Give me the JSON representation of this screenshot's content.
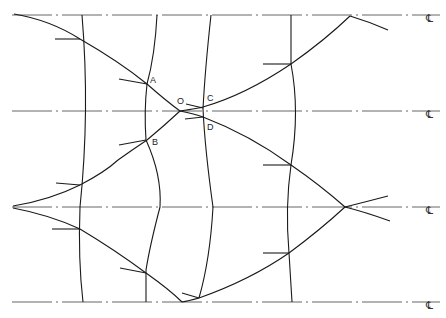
{
  "figure": {
    "type": "slip-line / characteristic network diagram",
    "colors": {
      "line": "#1a1a1a",
      "centerline": "#555555",
      "background": "#ffffff"
    }
  },
  "centerlines": [
    {
      "y": 15,
      "symbol": "℄"
    },
    {
      "y": 111,
      "symbol": "℄"
    },
    {
      "y": 207,
      "symbol": "℄"
    },
    {
      "y": 302,
      "symbol": "℄"
    }
  ],
  "point_labels": {
    "A": "A",
    "B": "B",
    "C": "C",
    "D": "D",
    "O": "O"
  }
}
